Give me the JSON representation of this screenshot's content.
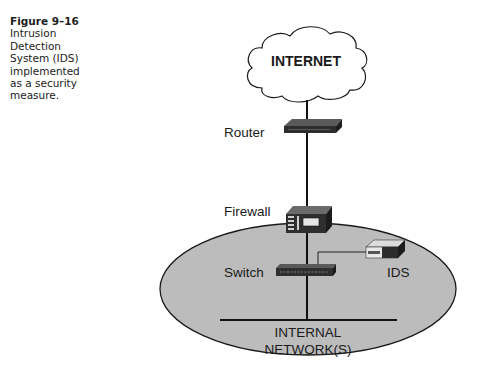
{
  "caption": {
    "figure_number": "Figure 9–16",
    "lines": [
      "Intrusion",
      "Detection",
      "System (IDS)",
      "implemented",
      "as a security",
      "measure."
    ]
  },
  "diagram": {
    "cloud_label": "INTERNET",
    "nodes": {
      "router": "Router",
      "firewall": "Firewall",
      "switch": "Switch",
      "ids": "IDS"
    },
    "network_label_line1": "INTERNAL",
    "network_label_line2": "NETWORK(S)",
    "colors": {
      "ellipse_fill": "#b9b9b9",
      "outline": "#1a1a1a",
      "device_dark": "#3a3a3a",
      "device_light": "#e8e8e8"
    }
  }
}
